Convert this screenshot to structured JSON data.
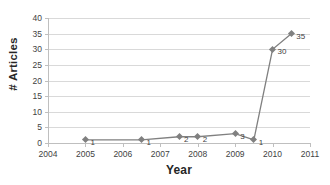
{
  "chart_data": {
    "type": "line",
    "title": "",
    "xlabel": "Year",
    "ylabel": "# Articles",
    "xlim": [
      2004,
      2011
    ],
    "ylim": [
      0,
      40
    ],
    "grid": true,
    "legend": "none",
    "xticks": [
      "2004",
      "2005",
      "2006",
      "2007",
      "2008",
      "2009",
      "2010",
      "2011"
    ],
    "xtick_values": [
      2004,
      2005,
      2006,
      2007,
      2008,
      2009,
      2010,
      2011
    ],
    "yticks": [
      "0",
      "5",
      "10",
      "15",
      "20",
      "25",
      "30",
      "35",
      "40"
    ],
    "ytick_values": [
      0,
      5,
      10,
      15,
      20,
      25,
      30,
      35,
      40
    ],
    "series": [
      {
        "name": "# Articles",
        "color": "#808080",
        "marker": "diamond",
        "x": [
          2005,
          2006.5,
          2007.5,
          2008,
          2009,
          2009.5,
          2010,
          2010.5
        ],
        "values": [
          1,
          1,
          2,
          2,
          3,
          1,
          30,
          35
        ],
        "point_labels": [
          "1",
          "1",
          "2",
          "2",
          "3",
          "1",
          "30",
          "35"
        ]
      }
    ]
  },
  "colors": {
    "series": "#808080",
    "gridline": "#d9d9d9",
    "axis": "#bfbfbf",
    "tick_text": "#3f3f3f",
    "title_text": "#262626",
    "background": "#ffffff"
  }
}
